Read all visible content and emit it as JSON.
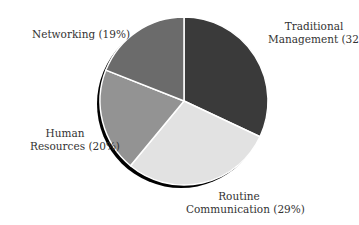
{
  "chart_data": {
    "type": "pie",
    "title": "",
    "start_angle_deg": -90,
    "direction": "clockwise",
    "slices": [
      {
        "label": "Traditional Management",
        "value": 32,
        "display": "Traditional Management (32%)",
        "color": "#3a3a3a"
      },
      {
        "label": "Routine Communication",
        "value": 29,
        "display": "Routine Communication (29%)",
        "color": "#e2e2e2"
      },
      {
        "label": "Human Resources",
        "value": 20,
        "display": "Human Resources (20%)",
        "color": "#939393"
      },
      {
        "label": "Networking",
        "value": 19,
        "display": "Networking (19%)",
        "color": "#6b6b6b"
      }
    ],
    "legend": "none (direct labels)",
    "shadow": true
  },
  "labels": {
    "traditional_line1": "Traditional",
    "traditional_line2": "Management (32%)",
    "routine_line1": "Routine",
    "routine_line2": "Communication (29%)",
    "human_line1": "Human",
    "human_line2": "Resources (20%)",
    "networking": "Networking (19%)"
  }
}
